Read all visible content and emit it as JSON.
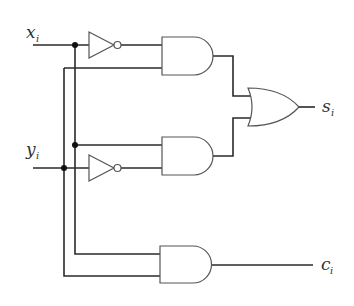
{
  "diagram": {
    "type": "logic-circuit",
    "inputs": [
      {
        "name": "x",
        "subscript": "i"
      },
      {
        "name": "y",
        "subscript": "i"
      }
    ],
    "outputs": [
      {
        "name": "s",
        "subscript": "i"
      },
      {
        "name": "c",
        "subscript": "i"
      }
    ],
    "gates": [
      {
        "id": "not-x",
        "type": "NOT",
        "input": "x_i"
      },
      {
        "id": "not-y",
        "type": "NOT",
        "input": "y_i"
      },
      {
        "id": "and-1",
        "type": "AND",
        "inputs": [
          "NOT x_i",
          "y_i"
        ]
      },
      {
        "id": "and-2",
        "type": "AND",
        "inputs": [
          "x_i",
          "NOT y_i"
        ]
      },
      {
        "id": "or-1",
        "type": "OR",
        "inputs": [
          "and-1",
          "and-2"
        ],
        "output": "s_i"
      },
      {
        "id": "and-3",
        "type": "AND",
        "inputs": [
          "x_i",
          "y_i"
        ],
        "output": "c_i"
      }
    ]
  },
  "labels": {
    "x": "x",
    "x_sub": "i",
    "y": "y",
    "y_sub": "i",
    "s": "s",
    "s_sub": "i",
    "c": "c",
    "c_sub": "i"
  }
}
